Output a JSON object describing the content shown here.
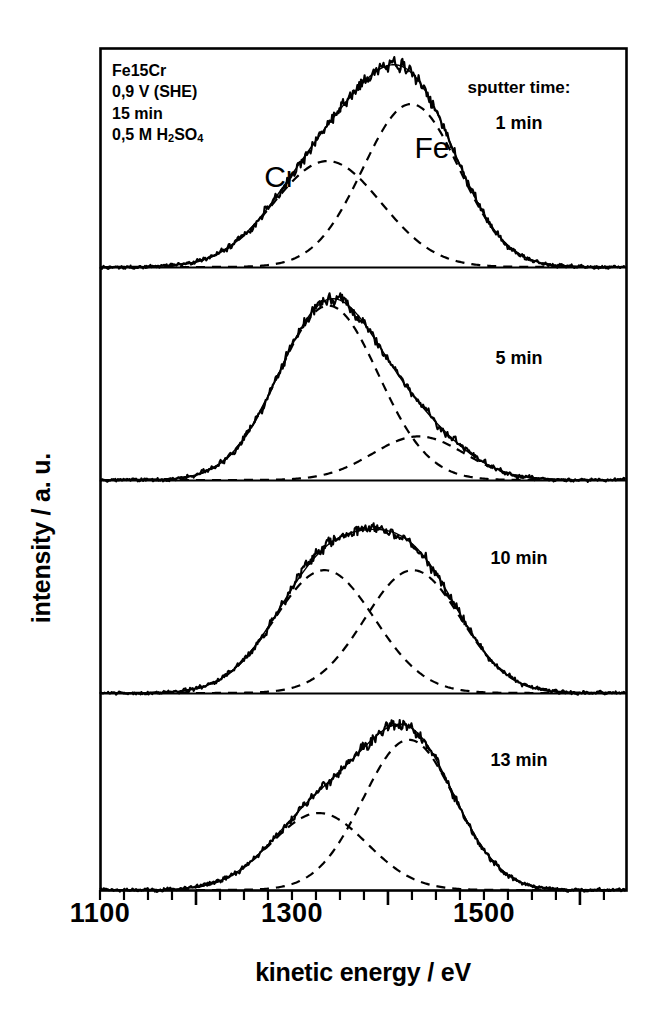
{
  "axes": {
    "xlabel": "kinetic energy / eV",
    "ylabel": "intensity / a. u.",
    "xtick_labels": [
      "1100",
      "1300",
      "1500"
    ]
  },
  "annotation": {
    "line1": "Fe15Cr",
    "line2": "0,9 V (SHE)",
    "line3": "15 min",
    "line4_pre": "0,5 M H",
    "line4_sub1": "2",
    "line4_mid": "SO",
    "line4_sub2": "4"
  },
  "legend": {
    "sputter_time_heading": "sputter time:"
  },
  "peak_labels": {
    "cr": "Cr",
    "fe": "Fe"
  },
  "panels": [
    {
      "time_label": "1 min"
    },
    {
      "time_label": "5 min"
    },
    {
      "time_label": "10 min"
    },
    {
      "time_label": "13 min"
    }
  ],
  "colors": {
    "ink": "#000000",
    "background": "#ffffff"
  },
  "chart_data": {
    "type": "line",
    "title": "",
    "xlabel": "kinetic energy / eV",
    "ylabel": "intensity / a. u.",
    "xlim": [
      1100,
      1648
    ],
    "ylim": [
      0,
      1
    ],
    "grid": false,
    "legend": "none",
    "xticks_major": [
      1100,
      1300,
      1500
    ],
    "xtick_minor_step": 25,
    "annotations": [
      "Fe15Cr",
      "0,9 V (SHE)",
      "15 min",
      "0,5 M H2SO4",
      "sputter time:"
    ],
    "panels": [
      {
        "name": "1 min",
        "sputter_time_min": 1,
        "components": [
          {
            "name": "Cr",
            "center": 1337,
            "sigma": 56,
            "amplitude": 0.52
          },
          {
            "name": "Fe",
            "center": 1424,
            "sigma": 50,
            "amplitude": 0.8
          }
        ],
        "envelope": "sum of Cr and Fe gaussians",
        "measured": "noisy solid trace overlaying envelope"
      },
      {
        "name": "5 min",
        "sputter_time_min": 5,
        "components": [
          {
            "name": "Cr",
            "center": 1338,
            "sigma": 52,
            "amplitude": 0.88
          },
          {
            "name": "Fe",
            "center": 1432,
            "sigma": 48,
            "amplitude": 0.22
          }
        ],
        "envelope": "sum of Cr and Fe gaussians",
        "measured": "noisy solid trace overlaying envelope"
      },
      {
        "name": "10 min",
        "sputter_time_min": 10,
        "components": [
          {
            "name": "Cr",
            "center": 1334,
            "sigma": 52,
            "amplitude": 0.62
          },
          {
            "name": "Fe",
            "center": 1426,
            "sigma": 50,
            "amplitude": 0.62
          }
        ],
        "envelope": "sum of Cr and Fe gaussians",
        "measured": "noisy solid trace overlaying envelope"
      },
      {
        "name": "13 min",
        "sputter_time_min": 13,
        "components": [
          {
            "name": "Cr",
            "center": 1328,
            "sigma": 50,
            "amplitude": 0.42
          },
          {
            "name": "Fe",
            "center": 1422,
            "sigma": 48,
            "amplitude": 0.82
          }
        ],
        "envelope": "sum of Cr and Fe gaussians",
        "measured": "noisy solid trace overlaying envelope"
      }
    ]
  }
}
